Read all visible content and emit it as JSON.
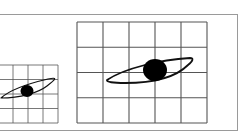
{
  "figure": {
    "colors": {
      "background": "#ffffff",
      "frame": "#9a9a9a",
      "grid": "#555555",
      "eye_outline": "#111111",
      "pupil": "#000000"
    },
    "small_grid": {
      "x": -2,
      "y": 65,
      "cols": 4,
      "rows": 4,
      "cell_w": 15,
      "cell_h": 14.5,
      "eye": {
        "path": "M1,98 C12,88 35,82 48,79 C58,77 56,79 47,86 C38,93 20,98 1,98 Z",
        "pupil": {
          "cx": 27,
          "cy": 91,
          "rx": 6.5,
          "ry": 6
        }
      }
    },
    "large_grid": {
      "x": 77,
      "y": 22,
      "cols": 5,
      "rows": 4,
      "cell_w": 26,
      "cell_h": 25.25,
      "eye": {
        "path": "M107,80 C125,68 160,60 190,58 C194,58 193,61 188,65 C175,78 150,83 125,83 C113,83 106,82 107,80 Z",
        "pupil": {
          "cx": 155,
          "cy": 70,
          "rx": 12,
          "ry": 11
        }
      }
    },
    "frame": {
      "x": -1,
      "y": 14,
      "w": 238,
      "h": 116
    }
  }
}
